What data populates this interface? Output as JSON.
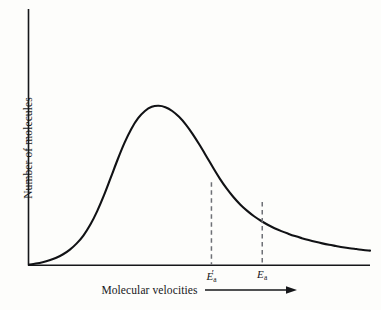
{
  "chart_data": {
    "type": "line",
    "title": "",
    "subtitle": "",
    "xlabel": "Molecular velocities",
    "ylabel": "Number of molecules",
    "xlabel_arrow": "arrow-right-icon",
    "grid": false,
    "legend": null,
    "axes": {
      "x_axis_visible": true,
      "y_axis_visible": true,
      "x_tick_labels": [
        "E'a",
        "Ea"
      ],
      "y_tick_labels": [],
      "xlim": [
        0,
        1
      ],
      "ylim": [
        0,
        1
      ]
    },
    "series": [
      {
        "name": "Maxwell-Boltzmann distribution of molecular velocities",
        "x": [
          0.0,
          0.02,
          0.04,
          0.06,
          0.08,
          0.1,
          0.12,
          0.14,
          0.16,
          0.18,
          0.2,
          0.22,
          0.24,
          0.26,
          0.28,
          0.3,
          0.32,
          0.34,
          0.36,
          0.38,
          0.4,
          0.42,
          0.44,
          0.46,
          0.48,
          0.5,
          0.52,
          0.54,
          0.56,
          0.58,
          0.6,
          0.62,
          0.64,
          0.66,
          0.68,
          0.7,
          0.72,
          0.74,
          0.76,
          0.78,
          0.8,
          0.82,
          0.84,
          0.86,
          0.88,
          0.9,
          0.92,
          0.94,
          0.96,
          0.98,
          1.0
        ],
        "y": [
          0.0,
          0.006,
          0.014,
          0.025,
          0.04,
          0.06,
          0.087,
          0.123,
          0.17,
          0.232,
          0.31,
          0.402,
          0.505,
          0.609,
          0.705,
          0.786,
          0.848,
          0.89,
          0.914,
          0.92,
          0.912,
          0.89,
          0.856,
          0.811,
          0.756,
          0.694,
          0.628,
          0.561,
          0.497,
          0.44,
          0.39,
          0.347,
          0.311,
          0.28,
          0.254,
          0.231,
          0.211,
          0.194,
          0.179,
          0.165,
          0.153,
          0.142,
          0.132,
          0.123,
          0.115,
          0.108,
          0.101,
          0.095,
          0.09,
          0.085,
          0.081
        ]
      }
    ],
    "annotations": [
      {
        "id": "ea-prime",
        "type": "vertical-dashed-line",
        "label": "E'a",
        "x": 0.535,
        "y_top": 0.477,
        "y_bottom": 0.0
      },
      {
        "id": "ea",
        "type": "vertical-dashed-line",
        "label": "Ea",
        "x": 0.684,
        "y_top": 0.363,
        "y_bottom": 0.0
      }
    ],
    "colors": {
      "background": "#fdfdfb",
      "axis": "#16171a",
      "curve": "#111215",
      "dashed_line": "#6e7076",
      "text": "#16171a"
    }
  },
  "labels": {
    "y_axis_title": "Number of molecules",
    "x_axis_title": "Molecular velocities",
    "tick_ea_prime_symbol": "E",
    "tick_ea_prime_mark": "′",
    "tick_ea_prime_sub": "a",
    "tick_ea_symbol": "E",
    "tick_ea_sub": "a"
  }
}
